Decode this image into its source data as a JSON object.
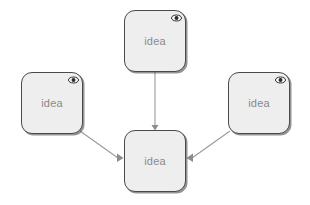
{
  "canvas": {
    "width": 310,
    "height": 205,
    "background": "#ffffff"
  },
  "style": {
    "node_fill": "#eeeeee",
    "node_border": "#4a4a4a",
    "label_color": "#8a8a8a",
    "edge_color": "#9a9a9a",
    "arrow_color": "#8c8c8c",
    "icon_color": "#2b2b2b"
  },
  "diagram": {
    "type": "mind-map",
    "nodes": [
      {
        "id": "top",
        "label": "idea",
        "x": 124,
        "y": 10,
        "w": 62,
        "h": 62,
        "icon": "eye-icon",
        "has_icon": true
      },
      {
        "id": "left",
        "label": "idea",
        "x": 21,
        "y": 72,
        "w": 62,
        "h": 62,
        "icon": "eye-icon",
        "has_icon": true
      },
      {
        "id": "right",
        "label": "idea",
        "x": 228,
        "y": 72,
        "w": 62,
        "h": 62,
        "icon": "eye-icon",
        "has_icon": true
      },
      {
        "id": "center",
        "label": "idea",
        "x": 124,
        "y": 130,
        "w": 62,
        "h": 62,
        "icon": null,
        "has_icon": false
      }
    ],
    "edges": [
      {
        "id": "top-to-center",
        "from": "top",
        "to": "center",
        "arrow": "triangle-down"
      },
      {
        "id": "left-to-center",
        "from": "left",
        "to": "center",
        "arrow": "triangle-right"
      },
      {
        "id": "right-to-center",
        "from": "right",
        "to": "center",
        "arrow": "triangle-left"
      }
    ]
  }
}
